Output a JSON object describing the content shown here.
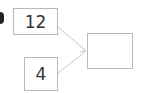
{
  "diagram": {
    "inputs": [
      {
        "value": "12"
      },
      {
        "value": "4"
      }
    ],
    "output": {
      "value": ""
    },
    "colors": {
      "border": "#b8b8b8",
      "arrow": "#c8c8c8",
      "text": "#333333"
    }
  }
}
